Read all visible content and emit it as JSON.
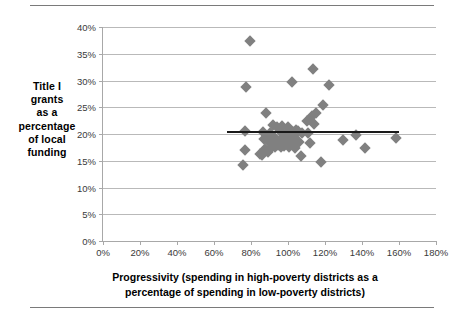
{
  "figure": {
    "rules": [
      "top-rule",
      "bottom-rule"
    ]
  },
  "chart_data": {
    "type": "scatter",
    "title": "",
    "xlabel": "Progressivity (spending in high-poverty districts as a percentage of spending in low-poverty districts)",
    "ylabel": "Title I grants as a percentage of local funding",
    "ylabel_lines": [
      "Title I",
      "grants",
      "as a",
      "percentage",
      "of local",
      "funding"
    ],
    "xlabel_lines": [
      "Progressivity (spending in high-poverty districts as a",
      "percentage of spending in low-poverty districts)"
    ],
    "xlim": [
      0,
      180
    ],
    "ylim": [
      0,
      40
    ],
    "xticks": [
      0,
      20,
      40,
      60,
      80,
      100,
      120,
      140,
      160,
      180
    ],
    "yticks": [
      0,
      5,
      10,
      15,
      20,
      25,
      30,
      35,
      40
    ],
    "xtick_labels": [
      "0%",
      "20%",
      "40%",
      "60%",
      "80%",
      "100%",
      "120%",
      "140%",
      "160%",
      "180%"
    ],
    "ytick_labels": [
      "0%",
      "5%",
      "10%",
      "15%",
      "20%",
      "25%",
      "30%",
      "35%",
      "40%"
    ],
    "grid": "horizontal",
    "legend": "none",
    "marker_shape": "diamond",
    "marker_color": "#808080",
    "trendline": {
      "color": "#1a1a1a",
      "y": 20.5,
      "x_start": 67,
      "x_end": 160
    },
    "points": [
      {
        "x": 75.5,
        "y": 14.2
      },
      {
        "x": 76.5,
        "y": 17.1
      },
      {
        "x": 77.0,
        "y": 20.5
      },
      {
        "x": 77.5,
        "y": 28.8
      },
      {
        "x": 79.5,
        "y": 37.4
      },
      {
        "x": 85.0,
        "y": 16.3
      },
      {
        "x": 86.0,
        "y": 16.1
      },
      {
        "x": 86.5,
        "y": 20.3
      },
      {
        "x": 87.0,
        "y": 19.1
      },
      {
        "x": 87.5,
        "y": 17.2
      },
      {
        "x": 88.0,
        "y": 24.0
      },
      {
        "x": 88.5,
        "y": 19.6
      },
      {
        "x": 89.0,
        "y": 16.6
      },
      {
        "x": 90.0,
        "y": 20.2
      },
      {
        "x": 90.5,
        "y": 18.3
      },
      {
        "x": 91.0,
        "y": 17.3
      },
      {
        "x": 92.0,
        "y": 21.7
      },
      {
        "x": 92.5,
        "y": 19.4
      },
      {
        "x": 93.0,
        "y": 17.6
      },
      {
        "x": 93.5,
        "y": 18.0
      },
      {
        "x": 94.0,
        "y": 21.4
      },
      {
        "x": 94.5,
        "y": 17.9
      },
      {
        "x": 95.0,
        "y": 18.6
      },
      {
        "x": 95.5,
        "y": 20.6
      },
      {
        "x": 96.0,
        "y": 17.5
      },
      {
        "x": 96.5,
        "y": 19.2
      },
      {
        "x": 97.0,
        "y": 21.5
      },
      {
        "x": 97.5,
        "y": 18.2
      },
      {
        "x": 98.0,
        "y": 17.8
      },
      {
        "x": 98.5,
        "y": 20.0
      },
      {
        "x": 99.0,
        "y": 19.0
      },
      {
        "x": 99.5,
        "y": 18.4
      },
      {
        "x": 100.0,
        "y": 21.3
      },
      {
        "x": 100.5,
        "y": 17.6
      },
      {
        "x": 101.0,
        "y": 19.8
      },
      {
        "x": 101.5,
        "y": 18.9
      },
      {
        "x": 102.0,
        "y": 29.7
      },
      {
        "x": 102.5,
        "y": 20.4
      },
      {
        "x": 103.0,
        "y": 18.1
      },
      {
        "x": 103.5,
        "y": 19.5
      },
      {
        "x": 104.0,
        "y": 17.4
      },
      {
        "x": 104.5,
        "y": 20.7
      },
      {
        "x": 105.0,
        "y": 18.7
      },
      {
        "x": 105.5,
        "y": 20.5
      },
      {
        "x": 106.0,
        "y": 18.5
      },
      {
        "x": 107.0,
        "y": 15.8
      },
      {
        "x": 107.5,
        "y": 20.1
      },
      {
        "x": 110.0,
        "y": 22.4
      },
      {
        "x": 111.0,
        "y": 20.2
      },
      {
        "x": 112.0,
        "y": 18.3
      },
      {
        "x": 113.0,
        "y": 23.3
      },
      {
        "x": 113.5,
        "y": 32.2
      },
      {
        "x": 114.0,
        "y": 21.8
      },
      {
        "x": 115.0,
        "y": 24.0
      },
      {
        "x": 118.0,
        "y": 14.8
      },
      {
        "x": 119.0,
        "y": 25.5
      },
      {
        "x": 122.0,
        "y": 29.1
      },
      {
        "x": 129.5,
        "y": 18.9
      },
      {
        "x": 136.5,
        "y": 19.8
      },
      {
        "x": 141.5,
        "y": 17.4
      },
      {
        "x": 158.5,
        "y": 19.3
      }
    ]
  }
}
